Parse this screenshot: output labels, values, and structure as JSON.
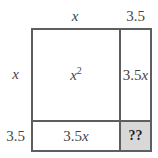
{
  "diagram": {
    "type": "area-model-grid",
    "background_color": "#ffffff",
    "border_color": "#5e5e5e",
    "highlight_color": "#d8d8d8",
    "text_color": "#454545",
    "column_headers": [
      {
        "name": "column-header-x",
        "label": "x",
        "italic": true
      },
      {
        "name": "column-header-3-5",
        "label": "3.5",
        "italic": false
      }
    ],
    "row_headers": [
      {
        "name": "row-header-x",
        "label": "x",
        "italic": true
      },
      {
        "name": "row-header-3-5",
        "label": "3.5",
        "italic": false
      }
    ],
    "cells": [
      {
        "name": "cell-x-squared",
        "row": 0,
        "col": 0,
        "base": "x",
        "exponent": "2",
        "label": "x2",
        "highlighted": false
      },
      {
        "name": "cell-top-right",
        "row": 0,
        "col": 1,
        "coefficient": "3.5",
        "variable": "x",
        "label": "3.5x",
        "highlighted": false
      },
      {
        "name": "cell-bottom-left",
        "row": 1,
        "col": 0,
        "coefficient": "3.5",
        "variable": "x",
        "label": "3.5x",
        "highlighted": false
      },
      {
        "name": "cell-unknown",
        "row": 1,
        "col": 1,
        "label": "??",
        "highlighted": true
      }
    ]
  }
}
